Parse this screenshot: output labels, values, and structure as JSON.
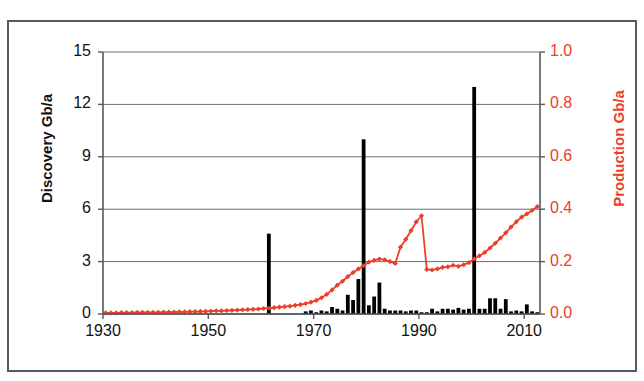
{
  "chart_data": {
    "type": "bar",
    "title": "",
    "subtitle": "",
    "xlabel": "",
    "ylabel": "Discovery Gb/a",
    "y2label": "Production Gb/a",
    "xlim": [
      1930,
      2013
    ],
    "ylim": [
      0,
      15
    ],
    "y2lim": [
      0,
      1.0
    ],
    "grid": true,
    "legend_position": "none",
    "x_ticks": [
      "1930",
      "1950",
      "1970",
      "1990",
      "2010"
    ],
    "x_tick_values": [
      1930,
      1950,
      1970,
      1990,
      2010
    ],
    "y_ticks": [
      "0",
      "3",
      "6",
      "9",
      "12",
      "15"
    ],
    "y_tick_values": [
      0,
      3,
      6,
      9,
      12,
      15
    ],
    "y2_ticks": [
      "0.0",
      "0.2",
      "0.4",
      "0.6",
      "0.8",
      "1.0"
    ],
    "y2_tick_values": [
      0.0,
      0.2,
      0.4,
      0.6,
      0.8,
      1.0
    ],
    "colors": {
      "discovery_bars": "#000000",
      "production_line": "#e8402a",
      "axis": "#55595c",
      "grid": "#6b6f72",
      "frame": "#555b5f",
      "background": "#ffffff"
    },
    "series": [
      {
        "name": "Discovery Gb/a",
        "type": "bar",
        "axis": "left",
        "color": "#000000",
        "x": [
          1930,
          1931,
          1932,
          1933,
          1934,
          1935,
          1936,
          1937,
          1938,
          1939,
          1940,
          1941,
          1942,
          1943,
          1944,
          1945,
          1946,
          1947,
          1948,
          1949,
          1950,
          1951,
          1952,
          1953,
          1954,
          1955,
          1956,
          1957,
          1958,
          1959,
          1960,
          1961,
          1962,
          1963,
          1964,
          1965,
          1966,
          1967,
          1968,
          1969,
          1970,
          1971,
          1972,
          1973,
          1974,
          1975,
          1976,
          1977,
          1978,
          1979,
          1980,
          1981,
          1982,
          1983,
          1984,
          1985,
          1986,
          1987,
          1988,
          1989,
          1990,
          1991,
          1992,
          1993,
          1994,
          1995,
          1996,
          1997,
          1998,
          1999,
          2000,
          2001,
          2002,
          2003,
          2004,
          2005,
          2006,
          2007,
          2008,
          2009,
          2010,
          2011,
          2012
        ],
        "values": [
          0,
          0,
          0,
          0,
          0,
          0,
          0,
          0,
          0,
          0,
          0,
          0,
          0,
          0,
          0,
          0,
          0,
          0,
          0,
          0,
          0,
          0,
          0,
          0,
          0,
          0,
          0,
          0,
          0,
          0,
          0,
          4.6,
          0,
          0,
          0,
          0,
          0,
          0,
          0.15,
          0.2,
          0.1,
          0.2,
          0.15,
          0.4,
          0.3,
          0.2,
          1.1,
          0.8,
          2.0,
          10.0,
          0.5,
          1.0,
          1.8,
          0.3,
          0.2,
          0.2,
          0.2,
          0.15,
          0.2,
          0.2,
          0.1,
          0.1,
          0.3,
          0.15,
          0.3,
          0.3,
          0.25,
          0.35,
          0.25,
          0.3,
          13.0,
          0.3,
          0.3,
          0.9,
          0.9,
          0.3,
          0.85,
          0.15,
          0.2,
          0.15,
          0.55,
          0.15,
          0.1
        ]
      },
      {
        "name": "Production Gb/a",
        "type": "line",
        "axis": "right",
        "color": "#e8402a",
        "marker": "diamond",
        "x": [
          1930,
          1931,
          1932,
          1933,
          1934,
          1935,
          1936,
          1937,
          1938,
          1939,
          1940,
          1941,
          1942,
          1943,
          1944,
          1945,
          1946,
          1947,
          1948,
          1949,
          1950,
          1951,
          1952,
          1953,
          1954,
          1955,
          1956,
          1957,
          1958,
          1959,
          1960,
          1961,
          1962,
          1963,
          1964,
          1965,
          1966,
          1967,
          1968,
          1969,
          1970,
          1971,
          1972,
          1973,
          1974,
          1975,
          1976,
          1977,
          1978,
          1979,
          1980,
          1981,
          1982,
          1983,
          1984,
          1985,
          1986,
          1987,
          1988,
          1989,
          1990,
          1991,
          1992,
          1993,
          1994,
          1995,
          1996,
          1997,
          1998,
          1999,
          2000,
          2001,
          2002,
          2003,
          2004,
          2005,
          2006,
          2007,
          2008,
          2009,
          2010,
          2011,
          2012
        ],
        "values": [
          0.004,
          0.004,
          0.004,
          0.005,
          0.005,
          0.005,
          0.006,
          0.006,
          0.006,
          0.006,
          0.006,
          0.007,
          0.007,
          0.007,
          0.008,
          0.008,
          0.009,
          0.009,
          0.01,
          0.01,
          0.011,
          0.012,
          0.012,
          0.013,
          0.014,
          0.015,
          0.016,
          0.017,
          0.018,
          0.019,
          0.021,
          0.022,
          0.024,
          0.026,
          0.028,
          0.03,
          0.033,
          0.036,
          0.04,
          0.045,
          0.052,
          0.062,
          0.075,
          0.092,
          0.11,
          0.125,
          0.143,
          0.158,
          0.172,
          0.185,
          0.198,
          0.205,
          0.21,
          0.207,
          0.2,
          0.193,
          0.185,
          0.182,
          0.18,
          0.182,
          0.186,
          0.19,
          0.178,
          0.183,
          0.188,
          0.192,
          0.186,
          0.182,
          0.188,
          0.196,
          0.21,
          0.222,
          0.235,
          0.252,
          0.27,
          0.29,
          0.31,
          0.332,
          0.352,
          0.37,
          0.382,
          0.395,
          0.41
        ],
        "annotations": [
          {
            "label": "spike",
            "x_range": [
              1988,
              1991
            ],
            "peak_value": 0.375,
            "note": "sharp rise to ~0.375 then abrupt drop to ~0.17"
          }
        ]
      }
    ],
    "production_spike": {
      "x": [
        1986,
        1987,
        1988,
        1989,
        1990,
        1991,
        1992,
        1993,
        1994,
        1995
      ],
      "values": [
        0.255,
        0.285,
        0.318,
        0.352,
        0.375,
        0.17,
        0.168,
        0.172,
        0.178,
        0.18
      ]
    }
  }
}
